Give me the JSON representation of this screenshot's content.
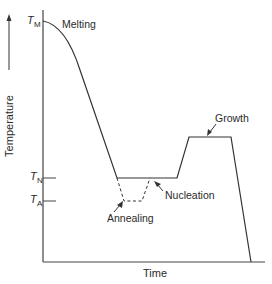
{
  "diagram": {
    "type": "temperature-time process diagram",
    "axes": {
      "x_label": "Time",
      "y_label": "Temperature",
      "y_ticks": [
        {
          "symbol": "T",
          "subscript": "M",
          "meaning": "melting temperature"
        },
        {
          "symbol": "T",
          "subscript": "N",
          "meaning": "nucleation temperature"
        },
        {
          "symbol": "T",
          "subscript": "A",
          "meaning": "annealing temperature"
        }
      ]
    },
    "annotations": {
      "melting": "Melting",
      "nucleation": "Nucleation",
      "growth": "Growth",
      "annealing": "Annealing"
    },
    "colors": {
      "line": "#333333",
      "background": "#ffffff"
    }
  }
}
